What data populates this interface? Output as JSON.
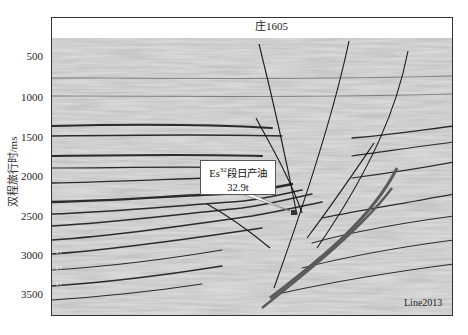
{
  "figure": {
    "well_label": "庄1605",
    "line_label": "Line2013",
    "y_axis": {
      "title": "双程旅行时/ms",
      "ticks": [
        {
          "value": "500",
          "y": 56
        },
        {
          "value": "1000",
          "y": 97
        },
        {
          "value": "1500",
          "y": 137
        },
        {
          "value": "2000",
          "y": 176
        },
        {
          "value": "2500",
          "y": 216
        },
        {
          "value": "3000",
          "y": 255
        },
        {
          "value": "3500",
          "y": 294
        }
      ]
    },
    "callout": {
      "prefix": "Es",
      "superscript": "32",
      "suffix": "段日产油",
      "value": "32.9t"
    },
    "horizon_labels": [
      "T?",
      "T?",
      "T?"
    ],
    "colors": {
      "background": "#e6e6e6",
      "fault_line": "#1a1a1a",
      "main_fault": "#555555",
      "reflector": "#2b2b2b"
    }
  }
}
